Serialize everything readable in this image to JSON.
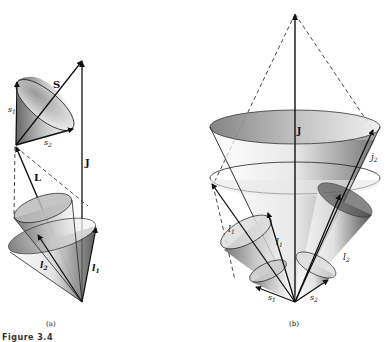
{
  "figure": {
    "caption": "Figure 3.4",
    "panels": [
      {
        "id": "a",
        "label": "(a)",
        "vector_labels": {
          "S": "S",
          "J": "J",
          "L": "L",
          "s1": "s",
          "s1_sub": "1",
          "s2": "s",
          "s2_sub": "2",
          "l1": "l",
          "l1_sub": "1",
          "l2": "l",
          "l2_sub": "2"
        }
      },
      {
        "id": "b",
        "label": "(b)",
        "vector_labels": {
          "J": "J",
          "j1": "j",
          "j1_sub": "1",
          "j2": "j",
          "j2_sub": "2",
          "l1a": "l",
          "l1a_sub": "1",
          "l1b": "l",
          "l1b_sub": "1",
          "l2": "l",
          "l2_sub": "2",
          "s1": "s",
          "s1_sub": "1",
          "s2": "s",
          "s2_sub": "2"
        }
      }
    ]
  }
}
